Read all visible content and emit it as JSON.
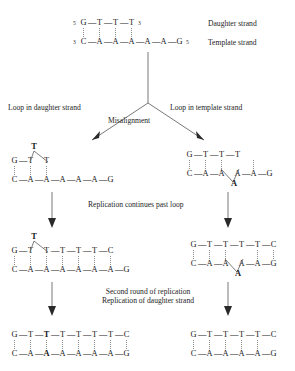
{
  "figure": {
    "background": "#ffffff",
    "ink": "#1a1a1a",
    "bond_color": "#8d8d8d"
  },
  "labels": {
    "daughter_strand": "Daughter strand",
    "template_strand": "Template strand",
    "loop_in_daughter": "Loop in daughter strand",
    "loop_in_template": "Loop in template strand",
    "misalignment": "Misalignment",
    "replication_continues": "Replication continues past loop",
    "second_round": "Second round of replication",
    "replication_of_daughter": "Replication of  daughter strand"
  },
  "primes": {
    "five": "5",
    "three": "3",
    "mark": "'"
  },
  "structures": {
    "start": {
      "name": "initial-duplex",
      "top": {
        "left_prime": "5",
        "right_prime": "3",
        "bases": [
          "G",
          "T",
          "T",
          "T"
        ]
      },
      "bottom": {
        "left_prime": "3",
        "right_prime": "5",
        "bases": [
          "C",
          "A",
          "A",
          "A",
          "A",
          "A",
          "G"
        ]
      }
    },
    "left_loop": {
      "name": "daughter-strand-loop",
      "looped_base": "T",
      "loop_position": "above",
      "top": {
        "bases": [
          "G",
          "T",
          "",
          "T"
        ]
      },
      "bottom": {
        "bases": [
          "C",
          "A",
          "A",
          "A",
          "A",
          "A",
          "G"
        ]
      }
    },
    "right_loop": {
      "name": "template-strand-loop",
      "looped_base": "A",
      "loop_position": "below",
      "top": {
        "bases": [
          "G",
          "T",
          "T",
          "T"
        ]
      },
      "bottom": {
        "bases": [
          "C",
          "A",
          "A",
          "",
          "A",
          "A",
          "G"
        ]
      }
    },
    "left_extended": {
      "name": "daughter-loop-extended",
      "looped_base": "T",
      "loop_position": "above",
      "top": {
        "bases": [
          "G",
          "T",
          "",
          "T",
          "T",
          "T",
          "T",
          "C"
        ]
      },
      "bottom": {
        "bases": [
          "C",
          "A",
          "A",
          "A",
          "A",
          "A",
          "A",
          "G"
        ]
      }
    },
    "right_extended": {
      "name": "template-loop-extended",
      "looped_base": "A",
      "loop_position": "below",
      "top": {
        "bases": [
          "G",
          "T",
          "T",
          "T",
          "T",
          "C"
        ]
      },
      "bottom": {
        "bases": [
          "C",
          "A",
          "A",
          "",
          "A",
          "A",
          "G"
        ]
      }
    },
    "left_final": {
      "name": "insertion-product",
      "top": {
        "bases": [
          "G",
          "T",
          "T",
          "T",
          "T",
          "T",
          "T",
          "C"
        ],
        "bold_index": 2
      },
      "bottom": {
        "bases": [
          "C",
          "A",
          "A",
          "A",
          "A",
          "A",
          "A",
          "G"
        ],
        "bold_index": 2
      }
    },
    "right_final": {
      "name": "deletion-product",
      "top": {
        "bases": [
          "G",
          "T",
          "T",
          "T",
          "T",
          "C"
        ],
        "bold_index": -1
      },
      "bottom": {
        "bases": [
          "C",
          "A",
          "A",
          "A",
          "A",
          "G"
        ],
        "bold_index": -1
      }
    }
  }
}
